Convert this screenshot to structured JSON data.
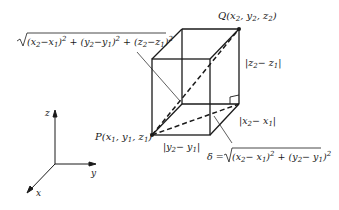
{
  "figure": {
    "stroke_color": "#1a1a1a",
    "background": "#ffffff"
  },
  "points": {
    "P": {
      "name": "P",
      "coords": "(x1, y1, z1)"
    },
    "Q": {
      "name": "Q",
      "coords": "(x2, y2, z2)"
    }
  },
  "labels": {
    "diagonal_formula": "√((x2−x1)² + (y2−y1)² + (z2−z1)²)",
    "z_edge": "|z2 − z1|",
    "x_edge": "|x2 − x1|",
    "y_edge": "|y2 − y1|",
    "delta_formula": "δ = √((x2−x1)² + (y2−y1)²)"
  },
  "axes": {
    "z": "z",
    "y": "y",
    "x": "x"
  }
}
